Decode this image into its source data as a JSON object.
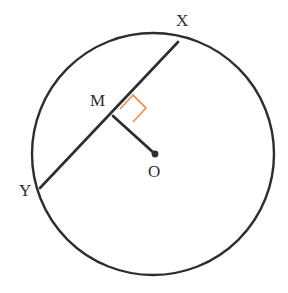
{
  "figure": {
    "background_color": "#ffffff",
    "stroke_color": "#2e2e32",
    "accent_color": "#e8945c"
  },
  "labels": {
    "point_x": "X",
    "point_y": "Y",
    "point_m": "M",
    "point_o": "O"
  },
  "geometry": {
    "circle": {
      "center_x": 153,
      "center_y": 154,
      "radius": 121,
      "stroke_width": 2.4,
      "stroke_color": "#2e2e32",
      "fill": "none"
    },
    "chord_xy": {
      "x1": 178,
      "y1": 42,
      "x2": 40,
      "y2": 188,
      "stroke_width": 2.6,
      "stroke_color": "#2e2e32"
    },
    "segment_om": {
      "x1": 113,
      "y1": 116,
      "x2": 155,
      "y2": 154,
      "stroke_width": 2.8,
      "stroke_color": "#2e2e32"
    },
    "center_dot": {
      "cx": 155,
      "cy": 154,
      "r": 3.4,
      "fill": "#2e2e32"
    },
    "right_angle_mark": {
      "points": "120,109 133,95 146,108 133,122",
      "stroke_width": 1.8,
      "stroke_color": "#e8945c",
      "fill": "none"
    }
  }
}
